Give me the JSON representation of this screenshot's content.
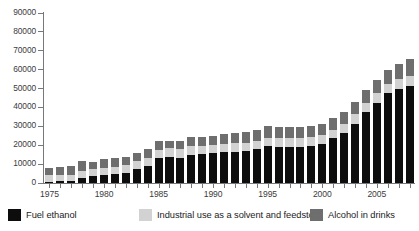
{
  "chart_data": {
    "type": "bar",
    "subtype": "stacked-bar",
    "title": "",
    "subtitle": "",
    "xlabel": "",
    "ylabel": "",
    "ylim": [
      0,
      90000
    ],
    "y_ticks": [
      0,
      10000,
      20000,
      30000,
      40000,
      50000,
      60000,
      70000,
      80000,
      90000
    ],
    "y_tick_labels": [
      "0",
      "10000",
      "20000",
      "30000",
      "40000",
      "50000",
      "60000",
      "70000",
      "80000",
      "90000"
    ],
    "grid": false,
    "legend_position": "bottom",
    "x_tick_labels": [
      "1975",
      "1980",
      "1985",
      "1990",
      "1995",
      "2000",
      "2005"
    ],
    "x_tick_years": [
      1975,
      1980,
      1985,
      1990,
      1995,
      2000,
      2005
    ],
    "categories": [
      "1975",
      "1976",
      "1977",
      "1978",
      "1979",
      "1980",
      "1981",
      "1982",
      "1983",
      "1984",
      "1985",
      "1986",
      "1987",
      "1988",
      "1989",
      "1990",
      "1991",
      "1992",
      "1993",
      "1994",
      "1995",
      "1996",
      "1997",
      "1998",
      "1999",
      "2000",
      "2001",
      "2002",
      "2003",
      "2004",
      "2005",
      "2006",
      "2007",
      "2008"
    ],
    "series": [
      {
        "name": "Fuel ethanol",
        "color": "#0d0d0d",
        "values": [
          800,
          900,
          1000,
          2600,
          3600,
          4300,
          4700,
          5300,
          7400,
          9100,
          13300,
          13900,
          13400,
          15000,
          15300,
          15800,
          16200,
          16500,
          16800,
          17900,
          19400,
          19000,
          19300,
          19300,
          19600,
          20800,
          23600,
          26600,
          31500,
          37600,
          42500,
          47500,
          50000,
          51500
        ]
      },
      {
        "name": "Industrial use as a solvent and feedstock",
        "color": "#d2d2d2",
        "values": [
          3500,
          3500,
          3500,
          3600,
          3800,
          3900,
          4000,
          4100,
          4200,
          4300,
          4400,
          4400,
          4400,
          4400,
          4400,
          4500,
          4500,
          4500,
          4500,
          4500,
          4600,
          4600,
          4600,
          4600,
          4600,
          4600,
          4700,
          4800,
          4800,
          4800,
          4900,
          5000,
          5000,
          5000
        ]
      },
      {
        "name": "Alcohol in drinks",
        "color": "#6e6e6e",
        "values": [
          3700,
          3900,
          4300,
          5300,
          3800,
          4300,
          4500,
          4200,
          4500,
          4500,
          4400,
          4200,
          4400,
          4700,
          4700,
          4400,
          5200,
          5400,
          5500,
          5800,
          6200,
          5900,
          5700,
          5800,
          5800,
          5900,
          6100,
          6400,
          6600,
          6900,
          7100,
          7400,
          8000,
          9000
        ]
      }
    ]
  },
  "legend": {
    "items": [
      {
        "label": "Fuel ethanol",
        "color": "#0d0d0d"
      },
      {
        "label": "Industrial use as a solvent and feedstock",
        "color": "#d2d2d2"
      },
      {
        "label": "Alcohol in drinks",
        "color": "#6e6e6e"
      }
    ]
  },
  "colors": {
    "fuel_ethanol": "#0d0d0d",
    "industrial": "#d2d2d2",
    "drinks": "#6e6e6e",
    "axis": "#76797b",
    "text": "#3c3c3c",
    "background": "#ffffff"
  }
}
